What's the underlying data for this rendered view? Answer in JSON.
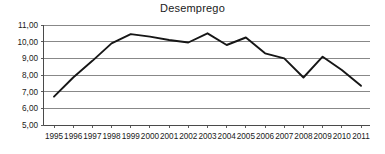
{
  "chart_data": {
    "type": "line",
    "title": "Desemprego",
    "xlabel": "",
    "ylabel": "",
    "x": [
      1995,
      1996,
      1997,
      1998,
      1999,
      2000,
      2001,
      2002,
      2003,
      2004,
      2005,
      2006,
      2007,
      2008,
      2009,
      2010,
      2011
    ],
    "categories": [
      "1995",
      "1996",
      "1997",
      "1998",
      "1999",
      "2000",
      "2001",
      "2002",
      "2003",
      "2004",
      "2005",
      "2006",
      "2007",
      "2008",
      "2009",
      "2010",
      "2011"
    ],
    "values": [
      6.7,
      7.85,
      8.85,
      9.9,
      10.45,
      10.3,
      10.1,
      9.95,
      10.5,
      9.8,
      10.25,
      9.3,
      9.0,
      7.85,
      9.1,
      8.3,
      7.35
    ],
    "series": [
      {
        "name": "Desemprego",
        "values": [
          6.7,
          7.85,
          8.85,
          9.9,
          10.45,
          10.3,
          10.1,
          9.95,
          10.5,
          9.8,
          10.25,
          9.3,
          9.0,
          7.85,
          9.1,
          8.3,
          7.35
        ]
      }
    ],
    "ylim": [
      5.0,
      11.0
    ],
    "y_ticks": [
      5.0,
      6.0,
      7.0,
      8.0,
      9.0,
      10.0,
      11.0
    ],
    "y_tick_labels": [
      "5,00",
      "6,00",
      "7,00",
      "8,00",
      "9,00",
      "10,00",
      "11,00"
    ],
    "xlim": [
      1995,
      2011
    ],
    "grid": true,
    "legend": false,
    "legend_position": "none",
    "line_color": "#161616",
    "grid_color": "#7b7b7b",
    "background_color": "#ffffff"
  }
}
